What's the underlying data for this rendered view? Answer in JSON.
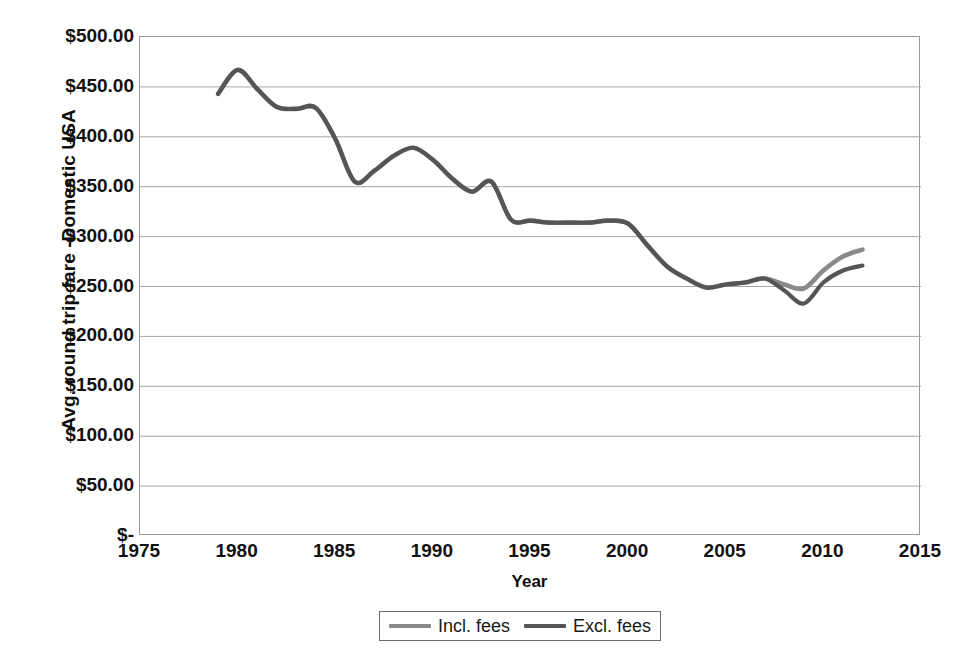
{
  "chart_data": {
    "type": "line",
    "title": "",
    "xlabel": "Year",
    "ylabel": "Avg. round trip fare -Domestic USA",
    "xlim": [
      1975,
      2015
    ],
    "ylim": [
      0,
      500
    ],
    "xticks": [
      "1975",
      "1980",
      "1985",
      "1990",
      "1995",
      "2000",
      "2005",
      "2010",
      "2015"
    ],
    "xtick_values": [
      1975,
      1980,
      1985,
      1990,
      1995,
      2000,
      2005,
      2010,
      2015
    ],
    "yticks": [
      "$-",
      "$50.00",
      "$100.00",
      "$150.00",
      "$200.00",
      "$250.00",
      "$300.00",
      "$350.00",
      "$400.00",
      "$450.00",
      "$500.00"
    ],
    "ytick_values": [
      0,
      50,
      100,
      150,
      200,
      250,
      300,
      350,
      400,
      450,
      500
    ],
    "grid": "horizontal",
    "legend_position": "bottom",
    "x": [
      1979,
      1980,
      1981,
      1982,
      1983,
      1984,
      1985,
      1986,
      1987,
      1988,
      1989,
      1990,
      1991,
      1992,
      1993,
      1994,
      1995,
      1996,
      1997,
      1998,
      1999,
      2000,
      2001,
      2002,
      2003,
      2004,
      2005,
      2006,
      2007,
      2008,
      2009,
      2010,
      2011,
      2012
    ],
    "series": [
      {
        "name": "Incl. fees",
        "color": "#8a8a8a",
        "values": [
          443,
          467,
          448,
          430,
          428,
          429,
          398,
          355,
          366,
          381,
          389,
          377,
          358,
          345,
          355,
          317,
          316,
          314,
          314,
          314,
          316,
          313,
          291,
          270,
          258,
          249,
          252,
          254,
          258,
          252,
          248,
          266,
          280,
          287
        ]
      },
      {
        "name": "Excl. fees",
        "color": "#555555",
        "values": [
          443,
          467,
          448,
          430,
          428,
          429,
          398,
          355,
          366,
          381,
          389,
          377,
          358,
          345,
          355,
          317,
          316,
          314,
          314,
          314,
          316,
          313,
          291,
          270,
          258,
          249,
          252,
          254,
          258,
          246,
          233,
          254,
          266,
          271
        ]
      }
    ],
    "annotations": []
  },
  "legend": {
    "entries": [
      {
        "label": "Incl. fees"
      },
      {
        "label": "Excl. fees"
      }
    ]
  },
  "axes": {
    "x_title": "Year",
    "y_title": "Avg. round trip fare -Domestic USA"
  },
  "colors": {
    "incl_fees_line": "#8a8a8a",
    "excl_fees_line": "#555555",
    "gridline": "#a6a6a6",
    "plot_border": "#9a9a9a",
    "text": "#111111",
    "background": "#ffffff"
  }
}
